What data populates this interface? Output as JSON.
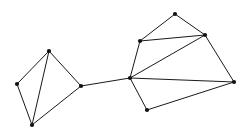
{
  "figure": {
    "background_color": "#ffffff",
    "width": 249,
    "height": 137,
    "edge_color": "#1a1a1a",
    "node_color": "#111111",
    "edge_width": 1,
    "node_radius": 2.1
  },
  "graph": {
    "node_count": 10,
    "edge_count": 15,
    "cluster_count": 2,
    "nodes": [
      {
        "id": "n0",
        "label": "left-top",
        "cluster": "left",
        "x": 49,
        "y": 51
      },
      {
        "id": "n1",
        "label": "left-west",
        "cluster": "left",
        "x": 17,
        "y": 84
      },
      {
        "id": "n2",
        "label": "left-bottom",
        "cluster": "left",
        "x": 32,
        "y": 125
      },
      {
        "id": "n3",
        "label": "left-bridge",
        "cluster": "left",
        "x": 81,
        "y": 86
      },
      {
        "id": "n4",
        "label": "hub",
        "cluster": "right",
        "x": 130,
        "y": 78
      },
      {
        "id": "n5",
        "label": "right-upper-left",
        "cluster": "right",
        "x": 140,
        "y": 41
      },
      {
        "id": "n6",
        "label": "right-apex",
        "cluster": "right",
        "x": 175,
        "y": 14
      },
      {
        "id": "n7",
        "label": "right-upper-right",
        "cluster": "right",
        "x": 205,
        "y": 35
      },
      {
        "id": "n8",
        "label": "right-east",
        "cluster": "right",
        "x": 234,
        "y": 82
      },
      {
        "id": "n9",
        "label": "right-bottom",
        "cluster": "right",
        "x": 147,
        "y": 110
      }
    ],
    "edges": [
      {
        "id": "e0",
        "from": "n0",
        "to": "n1",
        "kind": "cluster-left"
      },
      {
        "id": "e1",
        "from": "n1",
        "to": "n2",
        "kind": "cluster-left"
      },
      {
        "id": "e2",
        "from": "n0",
        "to": "n2",
        "kind": "cluster-left-diagonal"
      },
      {
        "id": "e3",
        "from": "n0",
        "to": "n3",
        "kind": "cluster-left"
      },
      {
        "id": "e4",
        "from": "n2",
        "to": "n3",
        "kind": "cluster-left"
      },
      {
        "id": "e5",
        "from": "n3",
        "to": "n4",
        "kind": "bridge"
      },
      {
        "id": "e6",
        "from": "n4",
        "to": "n5",
        "kind": "cluster-right"
      },
      {
        "id": "e7",
        "from": "n5",
        "to": "n6",
        "kind": "cluster-right"
      },
      {
        "id": "e8",
        "from": "n6",
        "to": "n7",
        "kind": "cluster-right"
      },
      {
        "id": "e9",
        "from": "n5",
        "to": "n7",
        "kind": "cluster-right"
      },
      {
        "id": "e10",
        "from": "n4",
        "to": "n7",
        "kind": "cluster-right-diagonal"
      },
      {
        "id": "e11",
        "from": "n7",
        "to": "n8",
        "kind": "cluster-right"
      },
      {
        "id": "e12",
        "from": "n4",
        "to": "n8",
        "kind": "cluster-right-diagonal"
      },
      {
        "id": "e13",
        "from": "n4",
        "to": "n9",
        "kind": "cluster-right"
      },
      {
        "id": "e14",
        "from": "n9",
        "to": "n8",
        "kind": "cluster-right"
      }
    ]
  }
}
